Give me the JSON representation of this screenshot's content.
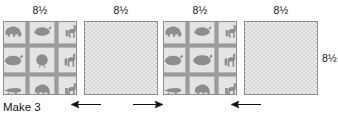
{
  "diagram": {
    "type": "quilt-block-assembly-diagram",
    "caption": "Make 3",
    "top_labels": [
      {
        "text": "8½"
      },
      {
        "text": "8½"
      },
      {
        "text": "8½"
      },
      {
        "text": "8½"
      }
    ],
    "side_label": {
      "text": "8½"
    },
    "blocks": [
      {
        "index": 1,
        "fabric": "animal-novelty-print",
        "label": "8½"
      },
      {
        "index": 2,
        "fabric": "checkered-tone-on-tone",
        "label": "8½"
      },
      {
        "index": 3,
        "fabric": "animal-novelty-print",
        "label": "8½"
      },
      {
        "index": 4,
        "fabric": "checkered-tone-on-tone",
        "label": "8½"
      }
    ],
    "arrows": [
      {
        "index": 1,
        "direction": "left",
        "icon": "arrow-left-icon"
      },
      {
        "index": 2,
        "direction": "right",
        "icon": "arrow-right-icon"
      },
      {
        "index": 3,
        "direction": "left",
        "icon": "arrow-left-icon"
      }
    ],
    "animal_motifs": [
      "elephant",
      "whale",
      "giraffe",
      "whale",
      "lion",
      "giraffe",
      "crocodile",
      "elephant",
      "giraffe"
    ],
    "colors": {
      "background": "#ffffff",
      "text": "#141414",
      "block_border": "#8e8e8e",
      "animal_fabric_base": "#9b9b9b",
      "animal_motif": "#8d8d8d",
      "animal_cell_bg": "#e4e4e4",
      "check_fabric_light": "#ededed",
      "check_fabric_dark": "#d4d4d4",
      "arrow": "#111111"
    }
  }
}
